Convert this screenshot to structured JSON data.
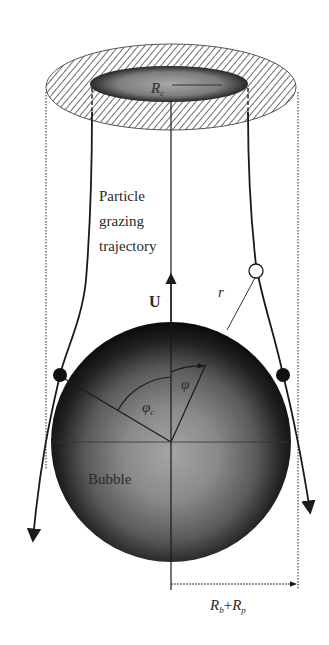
{
  "diagram": {
    "type": "physics schematic",
    "labels": {
      "collection_radius": "R",
      "collection_radius_sub": "c",
      "trajectory_label_line1": "Particle",
      "trajectory_label_line2": "grazing",
      "trajectory_label_line3": "trajectory",
      "velocity": "U",
      "radial_distance": "r",
      "polar_angle": "φ",
      "critical_angle": "φ",
      "critical_angle_sub": "c",
      "bubble": "Bubble",
      "sum_radii_Rb": "R",
      "sum_radii_Rb_sub": "b",
      "sum_radii_plus": "+",
      "sum_radii_Rp": "R",
      "sum_radii_Rp_sub": "p"
    },
    "elements": [
      {
        "id": "hatched-annulus",
        "desc": "Hatched ring at top showing collection cross-section"
      },
      {
        "id": "collection-disk",
        "desc": "Inner gray disk of radius R_c"
      },
      {
        "id": "flow-axis",
        "desc": "Central vertical axis with upward arrow U"
      },
      {
        "id": "bubble",
        "desc": "Shaded sphere, radius R_b"
      },
      {
        "id": "grazing-trajectories",
        "desc": "Two curved particle paths grazing the bubble, arrows pointing downward"
      },
      {
        "id": "particles",
        "desc": "Two black particles touching bubble, one open particle at distance r"
      },
      {
        "id": "dotted-guides",
        "desc": "Dotted vertical lines at distance R_b+R_p from axis"
      },
      {
        "id": "dashed-guides",
        "desc": "Dashed vertical lines from edge of inner disk"
      },
      {
        "id": "dimension-arrow",
        "desc": "Horizontal arrow from axis to dotted line labeled R_b+R_p"
      }
    ],
    "colors": {
      "ink": "#1a1a1a",
      "bubble_dark": "#0d0d0d",
      "bubble_light": "#9a9a9a",
      "hatch": "#6e6e6e",
      "background": "#ffffff"
    }
  }
}
